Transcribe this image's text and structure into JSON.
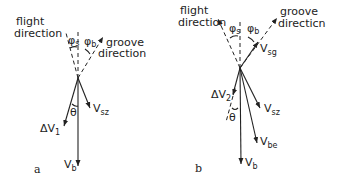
{
  "figure": {
    "panels": [
      {
        "id": "a",
        "label": "a",
        "flight_direction_label_1": "flight",
        "flight_direction_label_2": "direction",
        "groove_direction_label_1": "groove",
        "groove_direction_label_2": "direction",
        "angle_s": "φ",
        "angle_s_sub": "s",
        "angle_b": "φ",
        "angle_b_sub": "b",
        "theta": "θ",
        "vectors": {
          "delta_v": "ΔV",
          "delta_v_sub": "1",
          "v_sz": "V",
          "v_sz_sub": "sz",
          "v_b": "V",
          "v_b_sub": "b"
        }
      },
      {
        "id": "b",
        "label": "b",
        "flight_direction_label_1": "flight",
        "flight_direction_label_2": "direction",
        "groove_direction_label_1": "groove",
        "groove_direction_label_2": "directicn",
        "angle_s": "φ",
        "angle_s_sub": "s",
        "angle_b": "φ",
        "angle_b_sub": "b",
        "theta": "θ",
        "vectors": {
          "v_sg": "V",
          "v_sg_sub": "sg",
          "delta_v": "ΔV",
          "delta_v_sub": "2",
          "v_sz": "V",
          "v_sz_sub": "sz",
          "v_be": "V",
          "v_be_sub": "be",
          "v_b": "V",
          "v_b_sub": "b"
        }
      }
    ]
  }
}
